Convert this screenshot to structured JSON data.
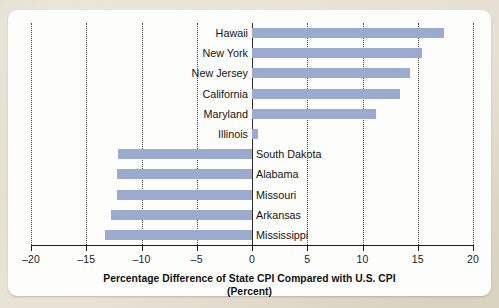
{
  "chart_data": {
    "type": "bar",
    "orientation": "horizontal",
    "title": "Percentage Difference of State CPI Compared with U.S. CPI",
    "subtitle": "(Percent)",
    "xlabel": "Percentage Difference of State CPI Compared with U.S. CPI (Percent)",
    "ylabel": "",
    "xlim": [
      -20,
      20
    ],
    "xticks": [
      -20,
      -15,
      -10,
      -5,
      0,
      5,
      10,
      15,
      20
    ],
    "xtick_labels": [
      "–20",
      "–15",
      "–10",
      "–5",
      "0",
      "5",
      "10",
      "15",
      "20"
    ],
    "grid": true,
    "grid_style": "dotted-vertical",
    "legend": null,
    "bar_color": "#9aabcf",
    "axis_color": "#1e1e1e",
    "categories": [
      "Hawaii",
      "New York",
      "New Jersey",
      "California",
      "Maryland",
      "Illinois",
      "South Dakota",
      "Alabama",
      "Missouri",
      "Arkansas",
      "Mississippi"
    ],
    "values": [
      17.4,
      15.4,
      14.3,
      13.4,
      11.2,
      0.5,
      -12.1,
      -12.2,
      -12.2,
      -12.8,
      -13.3
    ]
  },
  "caption": {
    "line1": "Percentage Difference of State CPI Compared with U.S. CPI",
    "line2": "(Percent)"
  }
}
